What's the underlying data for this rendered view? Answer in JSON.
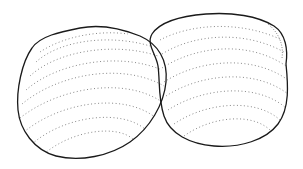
{
  "image": {
    "subject": "Two clam shells line drawing",
    "background": "#ffffff",
    "ink": "#1a1a1a",
    "stipple": "#444444"
  }
}
